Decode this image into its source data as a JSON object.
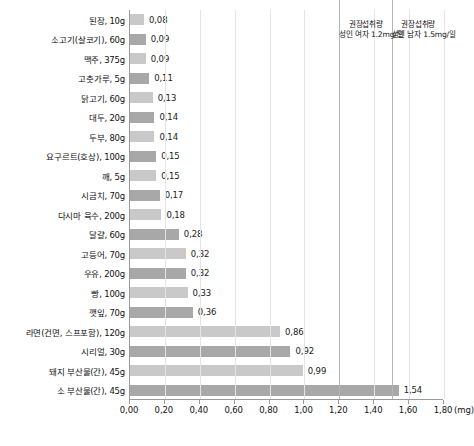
{
  "chart_data": {
    "type": "bar",
    "orientation": "horizontal",
    "title": "",
    "xlabel": "(mg)",
    "ylabel": "",
    "xlim": [
      0.0,
      1.8
    ],
    "xticks": [
      "0,00",
      "0,20",
      "0,40",
      "0,60",
      "0,80",
      "1,00",
      "1,20",
      "1,40",
      "1,60",
      "1,80"
    ],
    "xtick_values": [
      0.0,
      0.2,
      0.4,
      0.6,
      0.8,
      1.0,
      1.2,
      1.4,
      1.6,
      1.8
    ],
    "unit_label": "(mg)",
    "grid": true,
    "legend": "none",
    "categories": [
      "된장, 10g",
      "소고기(살코기), 60g",
      "맥주, 375g",
      "고춧가루, 5g",
      "닭고기, 60g",
      "대두, 20g",
      "두부, 80g",
      "요구르트(호상), 100g",
      "깨, 5g",
      "시금치, 70g",
      "다시마 육수, 200g",
      "달걀, 60g",
      "고등어, 70g",
      "우유, 200g",
      "빵, 100g",
      "깻잎, 70g",
      "라면(건면, 스프포함), 120g",
      "시리얼, 30g",
      "돼지 부산물(간), 45g",
      "소 부산물(간), 45g"
    ],
    "values": [
      0.08,
      0.09,
      0.09,
      0.11,
      0.13,
      0.14,
      0.14,
      0.15,
      0.15,
      0.17,
      0.18,
      0.28,
      0.32,
      0.32,
      0.33,
      0.36,
      0.86,
      0.92,
      0.99,
      1.54
    ],
    "value_labels": [
      "0,08",
      "0,09",
      "0,09",
      "0,11",
      "0,13",
      "0,14",
      "0,14",
      "0,15",
      "0,15",
      "0,17",
      "0,18",
      "0,28",
      "0,32",
      "0,32",
      "0,33",
      "0,36",
      "0,86",
      "0,92",
      "0,99",
      "1,54"
    ],
    "bar_colors": [
      "#c9c9c9",
      "#a8a8a8"
    ],
    "reference_lines": [
      {
        "value": 1.2,
        "label_line1": "권장섭취량",
        "label_line2": "성인 여자 1.2mg/일",
        "color": "#b5b5b5"
      },
      {
        "value": 1.5,
        "label_line1": "권장섭취량",
        "label_line2": "성인 남자 1.5mg/일",
        "color": "#b5b5b5"
      }
    ]
  }
}
